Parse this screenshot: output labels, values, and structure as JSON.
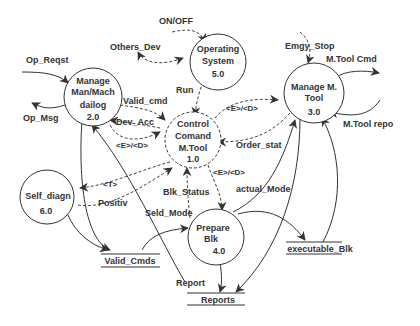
{
  "diagram": {
    "type": "data-flow-diagram",
    "processes": [
      {
        "id": "1.0",
        "lines": [
          "Control",
          "Comand",
          "M.Tool"
        ],
        "number": "1.0"
      },
      {
        "id": "2.0",
        "lines": [
          "Manage",
          "Man/Mach",
          "dailog"
        ],
        "number": "2.0"
      },
      {
        "id": "3.0",
        "lines": [
          "Manage M.",
          "Tool"
        ],
        "number": "3.0"
      },
      {
        "id": "4.0",
        "lines": [
          "Prepare",
          "Blk"
        ],
        "number": "4.0"
      },
      {
        "id": "5.0",
        "lines": [
          "Operating",
          "System"
        ],
        "number": "5.0"
      },
      {
        "id": "6.0",
        "lines": [
          "Self_diagn"
        ],
        "number": "6.0"
      }
    ],
    "stores": [
      {
        "id": "valid_cmds",
        "label": "Valid_Cmds"
      },
      {
        "id": "executable_blk",
        "label": "executable_Blk"
      },
      {
        "id": "reports",
        "label": "Reports"
      }
    ],
    "flows": {
      "on_off": "ON/OFF",
      "others_dev": "Others_Dev",
      "op_reqst": "Op_Reqst",
      "op_msg": "Op_Msg",
      "run": "Run",
      "valid_cmd": "Valid_cmd",
      "dev_acc": "Dev_Acc",
      "ed_2_1": "<E>/<D>",
      "ed_1_3": "<E>/<D>",
      "ed_1_4": "<E>/<D>",
      "emgy_stop": "Emgy_Stop",
      "mtool_cmd": "M.Tool Cmd",
      "mtool_rep": "M.Tool repo",
      "order_stat": "Order_stat",
      "t_flow": "<T>",
      "positiv": "Positiv",
      "blk_status": "Blk_Status",
      "seld_mode": "Seld_Mode",
      "actual_mode": "actual_Mode",
      "report": "Report"
    }
  }
}
